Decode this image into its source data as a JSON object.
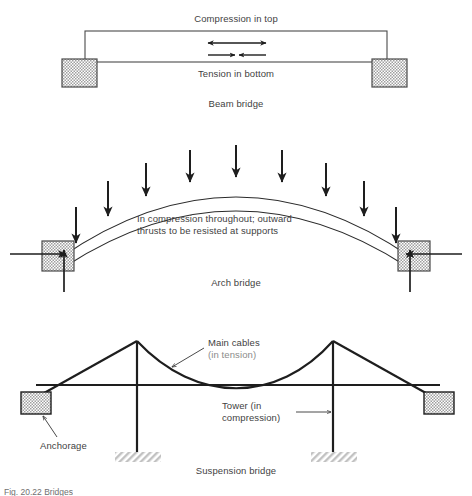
{
  "figure": {
    "caption": "Fig. 20.22  Bridges"
  },
  "beam": {
    "title": "Beam bridge",
    "top_label": "Compression in top",
    "bottom_label": "Tension in bottom",
    "support_name": "support-block",
    "compression_arrow": "double-headed-outward-arrow",
    "tension_arrow": "double-headed-inward-arrow"
  },
  "arch": {
    "title": "Arch bridge",
    "note_line1": "In compression throughout; outward",
    "note_line2": "thrusts to be resisted at supports",
    "load_arrow_count": 9,
    "abutment_name": "abutment-block",
    "horizontal_reaction": "horizontal-thrust-arrow",
    "vertical_reaction": "vertical-reaction-arrow"
  },
  "suspension": {
    "title": "Suspension bridge",
    "cable_label_line1": "Main cables",
    "cable_label_line2": "(in tension)",
    "tower_label_line1": "Tower (in",
    "tower_label_line2": "compression)",
    "anchorage_label": "Anchorage",
    "tower_count": 2,
    "anchorage_count": 2
  },
  "colors": {
    "ink": "#3f3f3f",
    "line": "#2b2b2b",
    "dim_text": "#8b8b8b",
    "hatch_fill": "#b9b9b9",
    "ground_hatch": "#c9c9c9",
    "background": "#ffffff"
  }
}
